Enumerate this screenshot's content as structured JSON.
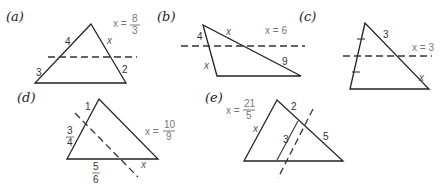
{
  "panels": [
    {
      "id": "a",
      "label": "(a)",
      "answer": {
        "prefix": "x =",
        "numerator": "8",
        "denominator": "3"
      },
      "segments": {
        "left_upper": "4",
        "left_lower": "3",
        "right_upper": "x",
        "right_lower": "2"
      }
    },
    {
      "id": "b",
      "label": "(b)",
      "answer": {
        "text": "x = 6"
      },
      "segments": {
        "left_upper": "4",
        "left_lower": "x",
        "right_upper": "x",
        "right_lower": "9"
      }
    },
    {
      "id": "c",
      "label": "(c)",
      "answer": {
        "text": "x = 3"
      },
      "segments": {
        "right_upper": "3",
        "right_lower": "x"
      },
      "left_side_marks": "equal tick marks"
    },
    {
      "id": "d",
      "label": "(d)",
      "answer": {
        "prefix": "x =",
        "numerator": "10",
        "denominator": "9"
      },
      "segments": {
        "left_upper": "1",
        "left_lower": {
          "numerator": "3",
          "denominator": "4"
        },
        "base_left": {
          "numerator": "5",
          "denominator": "6"
        },
        "base_right": "x"
      }
    },
    {
      "id": "e",
      "label": "(e)",
      "answer": {
        "prefix": "x =",
        "numerator": "21",
        "denominator": "5"
      },
      "segments": {
        "left_side": "x",
        "right_upper": "2",
        "right_lower": "5",
        "parallel_segment": "3"
      }
    }
  ]
}
